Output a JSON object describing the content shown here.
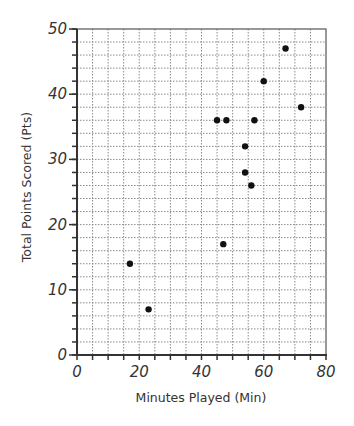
{
  "chart_data": {
    "type": "scatter",
    "title": "",
    "xlabel": "Minutes Played (Min)",
    "ylabel": "Total Points Scored (Pts)",
    "xlim": [
      0,
      80
    ],
    "ylim": [
      0,
      50
    ],
    "x_ticks": [
      0,
      20,
      40,
      60,
      80
    ],
    "y_ticks": [
      0,
      10,
      20,
      30,
      40,
      50
    ],
    "x_minor_step": 5,
    "y_minor_step": 2,
    "grid": true,
    "legend": null,
    "series": [
      {
        "name": "Players",
        "color": "#111111",
        "points": [
          {
            "x": 17,
            "y": 14
          },
          {
            "x": 23,
            "y": 7
          },
          {
            "x": 45,
            "y": 36
          },
          {
            "x": 47,
            "y": 17
          },
          {
            "x": 48,
            "y": 36
          },
          {
            "x": 54,
            "y": 32
          },
          {
            "x": 54,
            "y": 28
          },
          {
            "x": 56,
            "y": 26
          },
          {
            "x": 57,
            "y": 36
          },
          {
            "x": 60,
            "y": 42
          },
          {
            "x": 67,
            "y": 47
          },
          {
            "x": 72,
            "y": 38
          }
        ]
      }
    ]
  },
  "colors": {
    "axis": "#333333",
    "grid": "#8a8a8a",
    "marker": "#111111"
  }
}
